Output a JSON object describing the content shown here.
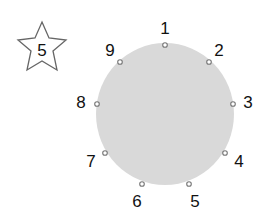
{
  "star": {
    "label": "5"
  },
  "circle": {
    "fill": "#d9d9d9"
  },
  "points": [
    {
      "label": "1",
      "x": 165,
      "y": 45,
      "lx": 165,
      "ly": 34
    },
    {
      "label": "2",
      "x": 209,
      "y": 62,
      "lx": 219,
      "ly": 56
    },
    {
      "label": "3",
      "x": 233,
      "y": 104,
      "lx": 248,
      "ly": 108
    },
    {
      "label": "4",
      "x": 225,
      "y": 153,
      "lx": 239,
      "ly": 167
    },
    {
      "label": "5",
      "x": 189,
      "y": 184,
      "lx": 195,
      "ly": 207
    },
    {
      "label": "6",
      "x": 142,
      "y": 184,
      "lx": 137,
      "ly": 207
    },
    {
      "label": "7",
      "x": 105,
      "y": 153,
      "lx": 91,
      "ly": 167
    },
    {
      "label": "8",
      "x": 97,
      "y": 104,
      "lx": 81,
      "ly": 108
    },
    {
      "label": "9",
      "x": 120,
      "y": 62,
      "lx": 110,
      "ly": 56
    }
  ]
}
